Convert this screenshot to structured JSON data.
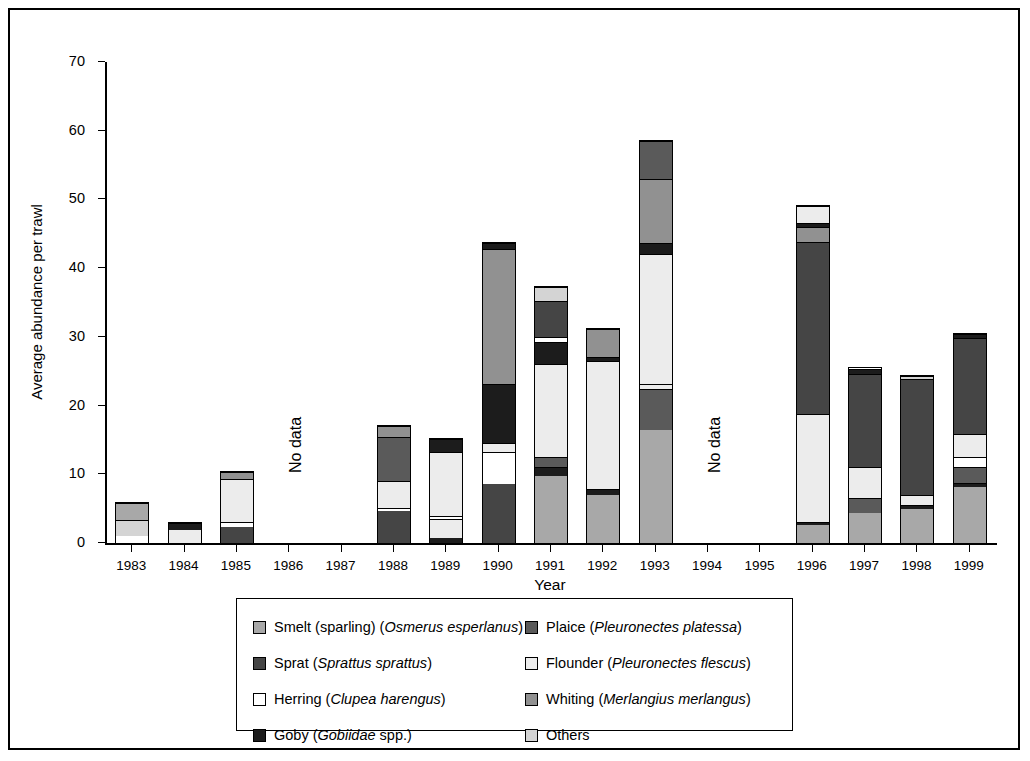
{
  "axes": {
    "ylabel": "Average abundance per trawl",
    "xlabel": "Year",
    "yticks": [
      0,
      10,
      20,
      30,
      40,
      50,
      60,
      70
    ],
    "ylim": [
      0,
      70
    ]
  },
  "annotations": [
    {
      "text": "No data",
      "category": "1986-1987"
    },
    {
      "text": "No data",
      "category": "1994-1995"
    }
  ],
  "legend": {
    "left": [
      {
        "label_plain": "Smelt (sparling) (",
        "label_italic": "Osmerus esperlanus",
        "label_tail": ")",
        "key": "smelt",
        "color": "#a8a8a8"
      },
      {
        "label_plain": "Sprat (",
        "label_italic": "Sprattus sprattus",
        "label_tail": ")",
        "key": "sprat",
        "color": "#454545"
      },
      {
        "label_plain": "Herring (",
        "label_italic": "Clupea harengus",
        "label_tail": ")",
        "key": "herring",
        "color": "#ffffff"
      },
      {
        "label_plain": "Goby (",
        "label_italic": "Gobiidae",
        "label_tail": " spp.)",
        "key": "goby",
        "color": "#1c1c1c"
      }
    ],
    "right": [
      {
        "label_plain": "Plaice (",
        "label_italic": "Pleuronectes platessa",
        "label_tail": ")",
        "key": "plaice",
        "color": "#5a5a5a"
      },
      {
        "label_plain": "Flounder (",
        "label_italic": "Pleuronectes flescus",
        "label_tail": ")",
        "key": "flounder",
        "color": "#ececec"
      },
      {
        "label_plain": "Whiting (",
        "label_italic": "Merlangius merlangus",
        "label_tail": ")",
        "key": "whiting",
        "color": "#919191"
      },
      {
        "label_plain": "Others",
        "label_italic": "",
        "label_tail": "",
        "key": "others",
        "color": "#d4d4d4"
      }
    ]
  },
  "chart_data": {
    "type": "bar",
    "subtype": "stacked",
    "title": "",
    "xlabel": "Year",
    "ylabel": "Average abundance per trawl",
    "ylim": [
      0,
      70
    ],
    "grid": false,
    "legend_position": "bottom",
    "categories": [
      "1983",
      "1984",
      "1985",
      "1986",
      "1987",
      "1988",
      "1989",
      "1990",
      "1991",
      "1992",
      "1993",
      "1994",
      "1995",
      "1996",
      "1997",
      "1998",
      "1999"
    ],
    "series": [
      {
        "name": "Smelt (sparling) (Osmerus esperlanus)",
        "key": "smelt",
        "color": "#a8a8a8",
        "values": [
          0,
          0,
          0,
          null,
          null,
          0,
          0,
          0,
          1.0,
          0,
          0,
          null,
          null,
          0,
          2.7,
          0,
          8.2
        ]
      },
      {
        "name": "Sprat (Sprattus sprattus)",
        "key": "sprat",
        "color": "#454545",
        "values": [
          0,
          0,
          2.4,
          null,
          null,
          4.6,
          0,
          8.6,
          0,
          7.0,
          0,
          null,
          null,
          0,
          0,
          5.0,
          0
        ]
      },
      {
        "name": "Herring (Clupea harengus)",
        "key": "herring",
        "color": "#ffffff",
        "values": [
          1.0,
          0,
          0.6,
          null,
          null,
          0.5,
          0.4,
          0,
          0.8,
          0,
          0,
          null,
          null,
          0,
          0.6,
          0,
          0
        ]
      },
      {
        "name": "Goby (Gobiidae spp.)",
        "key": "goby",
        "color": "#1c1c1c",
        "values": [
          0,
          0,
          0,
          null,
          null,
          0,
          0.8,
          0.6,
          0.5,
          0.4,
          0.9,
          null,
          null,
          0.5,
          0,
          0.5,
          0.4
        ]
      },
      {
        "name": "Plaice (Pleuronectes platessa)",
        "key": "plaice",
        "color": "#5a5a5a",
        "values": [
          0,
          0,
          0,
          null,
          null,
          3.6,
          0,
          0,
          1.5,
          0,
          15.3,
          null,
          null,
          2.0,
          3.4,
          0,
          2.4
        ]
      },
      {
        "name": "Flounder (Pleuronectes flescus)",
        "key": "flounder",
        "color": "#ececec",
        "values": [
          0,
          1.6,
          5.8,
          null,
          null,
          7.7,
          9.2,
          5.0,
          13.5,
          18.6,
          0.7,
          null,
          null,
          15.7,
          0,
          0.8,
          0
        ]
      },
      {
        "name": "Whiting (Merlangius merlangus)",
        "key": "whiting",
        "color": "#919191",
        "values": [
          0,
          0,
          0,
          null,
          null,
          0,
          0,
          0,
          0,
          0,
          19.0,
          null,
          null,
          0,
          0,
          0,
          0
        ]
      },
      {
        "name": "Others",
        "key": "others",
        "color": "#d4d4d4",
        "values": [
          2.4,
          0,
          0,
          null,
          null,
          0,
          0,
          0,
          0,
          0,
          0,
          null,
          null,
          0,
          0,
          0,
          3.0
        ]
      }
    ],
    "bars": [
      {
        "year": "1983",
        "total": 5.8,
        "stack": [
          {
            "key": "herring",
            "value": 1.0
          },
          {
            "key": "others",
            "value": 2.4
          },
          {
            "key": "smelt",
            "value": 2.4
          }
        ]
      },
      {
        "year": "1984",
        "total": 2.9,
        "stack": [
          {
            "key": "flounder",
            "value": 1.9
          },
          {
            "key": "goby",
            "value": 1.0
          }
        ]
      },
      {
        "year": "1985",
        "total": 10.3,
        "stack": [
          {
            "key": "sprat",
            "value": 2.4
          },
          {
            "key": "herring",
            "value": 0.6
          },
          {
            "key": "flounder",
            "value": 6.3
          },
          {
            "key": "whiting",
            "value": 1.0
          }
        ]
      },
      {
        "year": "1986",
        "total": null,
        "stack": []
      },
      {
        "year": "1987",
        "total": null,
        "stack": []
      },
      {
        "year": "1988",
        "total": 17.0,
        "stack": [
          {
            "key": "sprat",
            "value": 4.6
          },
          {
            "key": "herring",
            "value": 0.5
          },
          {
            "key": "flounder",
            "value": 3.9
          },
          {
            "key": "plaice",
            "value": 6.5
          },
          {
            "key": "whiting",
            "value": 1.5
          }
        ]
      },
      {
        "year": "1989",
        "total": 15.1,
        "stack": [
          {
            "key": "goby",
            "value": 0.8
          },
          {
            "key": "flounder",
            "value": 2.7
          },
          {
            "key": "herring",
            "value": 0.4
          },
          {
            "key": "flounder",
            "value": 9.4
          },
          {
            "key": "goby",
            "value": 1.8
          }
        ]
      },
      {
        "year": "1990",
        "total": 43.6,
        "stack": [
          {
            "key": "sprat",
            "value": 8.6
          },
          {
            "key": "herring",
            "value": 4.6
          },
          {
            "key": "flounder",
            "value": 1.4
          },
          {
            "key": "goby",
            "value": 8.6
          },
          {
            "key": "whiting",
            "value": 19.6
          },
          {
            "key": "goby",
            "value": 0.8
          }
        ]
      },
      {
        "year": "1991",
        "total": 37.3,
        "stack": [
          {
            "key": "smelt",
            "value": 9.8
          },
          {
            "key": "goby",
            "value": 1.2
          },
          {
            "key": "plaice",
            "value": 1.5
          },
          {
            "key": "flounder",
            "value": 13.5
          },
          {
            "key": "goby",
            "value": 3.2
          },
          {
            "key": "herring",
            "value": 0.8
          },
          {
            "key": "sprat",
            "value": 5.3
          },
          {
            "key": "others",
            "value": 2.0
          }
        ]
      },
      {
        "year": "1992",
        "total": 31.2,
        "stack": [
          {
            "key": "smelt",
            "value": 7.0
          },
          {
            "key": "goby",
            "value": 0.9
          },
          {
            "key": "flounder",
            "value": 18.6
          },
          {
            "key": "goby",
            "value": 0.6
          },
          {
            "key": "whiting",
            "value": 4.1
          }
        ]
      },
      {
        "year": "1993",
        "total": 58.5,
        "stack": [
          {
            "key": "smelt",
            "value": 16.4
          },
          {
            "key": "plaice",
            "value": 6.0
          },
          {
            "key": "flounder",
            "value": 0.7
          },
          {
            "key": "flounder",
            "value": 19.0
          },
          {
            "key": "goby",
            "value": 1.6
          },
          {
            "key": "whiting",
            "value": 9.3
          },
          {
            "key": "plaice",
            "value": 5.5
          }
        ]
      },
      {
        "year": "1994",
        "total": null,
        "stack": []
      },
      {
        "year": "1995",
        "total": null,
        "stack": []
      },
      {
        "year": "1996",
        "total": 49.0,
        "stack": [
          {
            "key": "smelt",
            "value": 2.6
          },
          {
            "key": "goby",
            "value": 0.5
          },
          {
            "key": "flounder",
            "value": 15.7
          },
          {
            "key": "sprat",
            "value": 25.0
          },
          {
            "key": "whiting",
            "value": 2.2
          },
          {
            "key": "goby",
            "value": 0.6
          },
          {
            "key": "flounder",
            "value": 2.4
          }
        ]
      },
      {
        "year": "1997",
        "total": 25.4,
        "stack": [
          {
            "key": "smelt",
            "value": 4.4
          },
          {
            "key": "plaice",
            "value": 2.1
          },
          {
            "key": "flounder",
            "value": 4.5
          },
          {
            "key": "sprat",
            "value": 13.6
          },
          {
            "key": "goby",
            "value": 0.8
          }
        ]
      },
      {
        "year": "1998",
        "total": 24.3,
        "stack": [
          {
            "key": "smelt",
            "value": 5.0
          },
          {
            "key": "goby",
            "value": 0.5
          },
          {
            "key": "flounder",
            "value": 1.5
          },
          {
            "key": "sprat",
            "value": 16.9
          },
          {
            "key": "others",
            "value": 0.4
          }
        ]
      },
      {
        "year": "1999",
        "total": 30.4,
        "stack": [
          {
            "key": "smelt",
            "value": 8.2
          },
          {
            "key": "goby",
            "value": 0.5
          },
          {
            "key": "plaice",
            "value": 2.4
          },
          {
            "key": "herring",
            "value": 1.4
          },
          {
            "key": "flounder",
            "value": 3.3
          },
          {
            "key": "sprat",
            "value": 14.0
          },
          {
            "key": "goby",
            "value": 0.6
          }
        ]
      }
    ]
  }
}
